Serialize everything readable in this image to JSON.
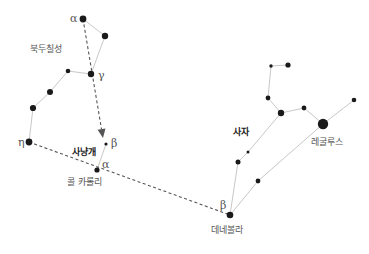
{
  "diagram": {
    "title": "",
    "colors": {
      "background": "#ffffff",
      "star": "#1a1a1a",
      "constellation_line": "#c8c8c8",
      "pointer_line": "#555555",
      "label": "#555555",
      "label_bold": "#222222"
    },
    "constellations": [
      {
        "name": "북두칠성",
        "label": "북두칠성",
        "label_pos": [
          30,
          52
        ],
        "bold": false,
        "stars": [
          {
            "id": "ub-alpha",
            "x": 83,
            "y": 19,
            "r": 3.4,
            "greek": "α",
            "greek_pos": [
              70,
              22
            ]
          },
          {
            "id": "ub-beta",
            "x": 105,
            "y": 36,
            "r": 3.2
          },
          {
            "id": "ub-gamma",
            "x": 91,
            "y": 74,
            "r": 3.2,
            "greek": "γ",
            "greek_pos": [
              98,
              79
            ]
          },
          {
            "id": "ub-delta",
            "x": 68,
            "y": 71,
            "r": 2.3
          },
          {
            "id": "ub-eps",
            "x": 50,
            "y": 92,
            "r": 3.0
          },
          {
            "id": "ub-zeta",
            "x": 33,
            "y": 108,
            "r": 3.1
          },
          {
            "id": "ub-eta",
            "x": 29,
            "y": 142,
            "r": 3.4,
            "greek": "η",
            "greek_pos": [
              18,
              146
            ]
          }
        ],
        "lines": [
          [
            "ub-alpha",
            "ub-beta"
          ],
          [
            "ub-beta",
            "ub-gamma"
          ],
          [
            "ub-gamma",
            "ub-delta"
          ],
          [
            "ub-delta",
            "ub-eps"
          ],
          [
            "ub-eps",
            "ub-zeta"
          ],
          [
            "ub-zeta",
            "ub-eta"
          ]
        ]
      },
      {
        "name": "사냥개",
        "label": "사냥개",
        "label_pos": [
          72,
          155
        ],
        "bold": true,
        "stars": [
          {
            "id": "cv-beta",
            "x": 106,
            "y": 144,
            "r": 1.6,
            "greek": "β",
            "greek_pos": [
              111,
              147
            ]
          },
          {
            "id": "cv-alpha",
            "x": 97,
            "y": 170,
            "r": 2.6,
            "greek": "α",
            "greek_pos": [
              102,
              168
            ]
          }
        ],
        "lines": [
          [
            "cv-beta",
            "cv-alpha"
          ]
        ],
        "star_labels": [
          {
            "text": "콜 카롤리",
            "x": 67,
            "y": 185
          }
        ]
      },
      {
        "name": "사자",
        "label": "사자",
        "label_pos": [
          233,
          135
        ],
        "bold": true,
        "stars": [
          {
            "id": "leo-1",
            "x": 271,
            "y": 66,
            "r": 1.7
          },
          {
            "id": "leo-2",
            "x": 288,
            "y": 65,
            "r": 2.6
          },
          {
            "id": "leo-3",
            "x": 268,
            "y": 98,
            "r": 2.4
          },
          {
            "id": "leo-4",
            "x": 281,
            "y": 113,
            "r": 3.2
          },
          {
            "id": "leo-5",
            "x": 304,
            "y": 108,
            "r": 2.4
          },
          {
            "id": "leo-regulus",
            "x": 323,
            "y": 124,
            "r": 5.2
          },
          {
            "id": "leo-6",
            "x": 354,
            "y": 100,
            "r": 2.3
          },
          {
            "id": "leo-7",
            "x": 248,
            "y": 152,
            "r": 1.5
          },
          {
            "id": "leo-8",
            "x": 238,
            "y": 162,
            "r": 2.5
          },
          {
            "id": "leo-9",
            "x": 258,
            "y": 181,
            "r": 2.4
          },
          {
            "id": "leo-denebola",
            "x": 230,
            "y": 215,
            "r": 3.3,
            "greek": "β",
            "greek_pos": [
              220,
              209
            ]
          }
        ],
        "lines": [
          [
            "leo-1",
            "leo-2"
          ],
          [
            "leo-1",
            "leo-3"
          ],
          [
            "leo-3",
            "leo-4"
          ],
          [
            "leo-4",
            "leo-5"
          ],
          [
            "leo-5",
            "leo-regulus"
          ],
          [
            "leo-regulus",
            "leo-6"
          ],
          [
            "leo-4",
            "leo-7"
          ],
          [
            "leo-7",
            "leo-8"
          ],
          [
            "leo-8",
            "leo-denebola"
          ],
          [
            "leo-denebola",
            "leo-9"
          ],
          [
            "leo-9",
            "leo-regulus"
          ]
        ],
        "star_labels": [
          {
            "text": "레굴루스",
            "x": 311,
            "y": 145
          },
          {
            "text": "데네볼라",
            "x": 211,
            "y": 233
          }
        ]
      }
    ],
    "pointers": [
      {
        "id": "pointer-to-cv-beta",
        "from": [
          83,
          19
        ],
        "to": [
          103,
          138
        ],
        "arrow": true
      },
      {
        "id": "pointer-eta-to-denebola",
        "from": [
          29,
          142
        ],
        "to": [
          230,
          215
        ],
        "arrow": false
      }
    ]
  }
}
